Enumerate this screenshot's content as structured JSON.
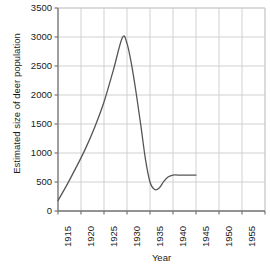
{
  "chart_data": {
    "type": "line",
    "title": "",
    "xlabel": "Year",
    "ylabel": "Estimated size of deer population",
    "xlim": [
      1915,
      1960
    ],
    "ylim": [
      0,
      3500
    ],
    "xticks": [
      1915,
      1920,
      1925,
      1930,
      1935,
      1940,
      1945,
      1950,
      1955,
      1960
    ],
    "yticks": [
      0,
      500,
      1000,
      1500,
      2000,
      2500,
      3000,
      3500
    ],
    "grid": true,
    "legend": "none",
    "line_color": "#555555",
    "grid_color": "#cccccc",
    "axis_color": "#777777",
    "background_color": "#ffffff",
    "series": [
      {
        "name": "Estimated deer population",
        "x": [
          1915,
          1917,
          1919,
          1921,
          1923,
          1925,
          1927,
          1929,
          1930,
          1931,
          1932,
          1933,
          1934,
          1935,
          1936,
          1937,
          1938,
          1939,
          1940,
          1941,
          1942,
          1943,
          1944,
          1945
        ],
        "values": [
          180,
          460,
          760,
          1080,
          1450,
          1880,
          2420,
          2990,
          2890,
          2520,
          2030,
          1480,
          900,
          500,
          370,
          395,
          510,
          590,
          620,
          620,
          620,
          620,
          620,
          620
        ]
      }
    ],
    "annotations": {
      "peak_year": 1929,
      "peak_value": 3000,
      "trough_year": 1936,
      "trough_value": 370,
      "plateau_value": 620,
      "plateau_start_year": 1940,
      "plateau_end_year": 1945,
      "start_year": 1915,
      "start_value": 180
    }
  }
}
